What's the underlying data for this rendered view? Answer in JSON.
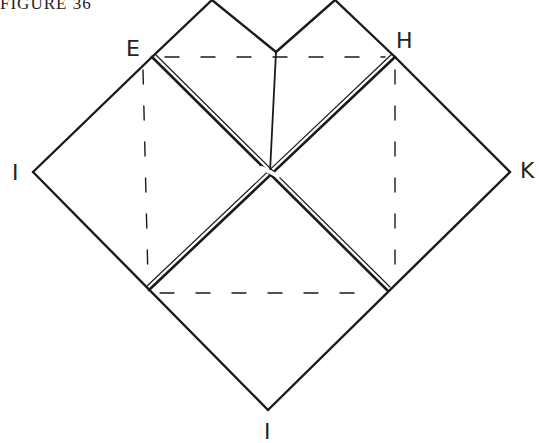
{
  "caption": "FIGURE 36",
  "labels": {
    "E": "E",
    "H": "H",
    "I": "I",
    "K": "K",
    "J": "I"
  },
  "colors": {
    "ink": "#1a1a1a",
    "background": "#ffffff"
  },
  "diagram": {
    "vertices": {
      "E": [
        152,
        57
      ],
      "H": [
        395,
        57
      ],
      "I": [
        33,
        172
      ],
      "K": [
        510,
        172
      ],
      "J": [
        268,
        410
      ],
      "lower_left": [
        149,
        290
      ],
      "lower_right": [
        387,
        290
      ],
      "center": [
        270,
        172
      ],
      "top_notch": [
        276,
        52
      ],
      "top_peak_left": [
        212,
        0
      ],
      "top_peak_right": [
        335,
        0
      ]
    }
  }
}
